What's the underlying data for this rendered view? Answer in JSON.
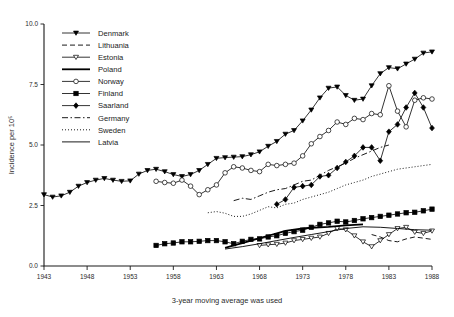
{
  "chart_data": {
    "type": "line",
    "title": "",
    "xlabel": "3-year moving average was used",
    "ylabel": "Incidence per 10⁵",
    "xlim": [
      1943,
      1988
    ],
    "ylim": [
      0.0,
      10.0
    ],
    "xticks": [
      1943,
      1948,
      1953,
      1958,
      1963,
      1968,
      1973,
      1978,
      1983,
      1988
    ],
    "xtick_labels": [
      "1943",
      "1948",
      "1953",
      "1958",
      "1963",
      "1968",
      "1973",
      "1978",
      "1983",
      "1988"
    ],
    "yticks": [
      0.0,
      2.5,
      5.0,
      7.5,
      10.0
    ],
    "ytick_labels": [
      "0.0",
      "2.5",
      "5.0",
      "7.5",
      "10.0"
    ],
    "grid": false,
    "legend_position": "upper-left-inside",
    "series": [
      {
        "name": "Denmark",
        "marker": "triangle-down-filled",
        "line": "solid",
        "x": [
          1943,
          1944,
          1945,
          1946,
          1947,
          1948,
          1949,
          1950,
          1951,
          1952,
          1953,
          1954,
          1955,
          1956,
          1957,
          1958,
          1959,
          1960,
          1961,
          1962,
          1963,
          1964,
          1965,
          1966,
          1967,
          1968,
          1969,
          1970,
          1971,
          1972,
          1973,
          1974,
          1975,
          1976,
          1977,
          1978,
          1979,
          1980,
          1981,
          1982,
          1983,
          1984,
          1985,
          1986,
          1987,
          1988
        ],
        "y": [
          2.95,
          2.85,
          2.9,
          3.05,
          3.3,
          3.45,
          3.55,
          3.62,
          3.55,
          3.5,
          3.52,
          3.8,
          3.95,
          4.0,
          3.9,
          3.78,
          3.7,
          3.78,
          3.95,
          4.2,
          4.45,
          4.48,
          4.5,
          4.52,
          4.6,
          4.72,
          4.95,
          5.15,
          5.45,
          5.6,
          6.0,
          6.45,
          6.95,
          7.35,
          7.4,
          7.05,
          6.85,
          6.9,
          7.45,
          7.95,
          8.2,
          8.15,
          8.35,
          8.55,
          8.8,
          8.85
        ]
      },
      {
        "name": "Lithuania",
        "marker": "none",
        "line": "dashed",
        "x": [
          1981,
          1982,
          1983,
          1984,
          1985,
          1986,
          1987,
          1988
        ],
        "y": [
          1.3,
          1.2,
          1.05,
          1.0,
          1.12,
          1.2,
          1.15,
          1.1
        ]
      },
      {
        "name": "Estonia",
        "marker": "triangle-down-open",
        "line": "solid",
        "x": [
          1968,
          1969,
          1970,
          1971,
          1972,
          1973,
          1974,
          1975,
          1976,
          1977,
          1978,
          1979,
          1980,
          1981,
          1982,
          1983,
          1984,
          1985,
          1986,
          1987,
          1988
        ],
        "y": [
          0.85,
          0.88,
          0.9,
          0.95,
          1.05,
          1.1,
          1.15,
          1.2,
          1.35,
          1.55,
          1.5,
          1.25,
          1.0,
          0.8,
          1.05,
          1.3,
          1.55,
          1.6,
          1.4,
          1.35,
          1.45
        ]
      },
      {
        "name": "Poland",
        "marker": "none",
        "line": "solid-thick",
        "x": [
          1964,
          1965,
          1966,
          1967,
          1968,
          1969,
          1970,
          1971,
          1972,
          1973,
          1974,
          1975,
          1976,
          1977,
          1978,
          1979,
          1980
        ],
        "y": [
          0.75,
          0.85,
          0.95,
          1.05,
          1.15,
          1.25,
          1.35,
          1.45,
          1.5,
          1.55,
          1.58,
          1.6,
          1.62,
          1.65,
          1.68,
          1.7,
          1.72
        ]
      },
      {
        "name": "Norway",
        "marker": "circle-open",
        "line": "solid",
        "x": [
          1956,
          1957,
          1958,
          1959,
          1960,
          1961,
          1962,
          1963,
          1964,
          1965,
          1966,
          1967,
          1968,
          1969,
          1970,
          1971,
          1972,
          1973,
          1974,
          1975,
          1976,
          1977,
          1978,
          1979,
          1980,
          1981,
          1982,
          1983,
          1984,
          1985,
          1986,
          1987,
          1988
        ],
        "y": [
          3.5,
          3.45,
          3.42,
          3.55,
          3.3,
          2.95,
          3.15,
          3.35,
          3.85,
          4.1,
          4.05,
          3.95,
          3.9,
          4.2,
          4.15,
          4.2,
          4.25,
          4.55,
          5.05,
          5.35,
          5.6,
          5.95,
          5.85,
          6.1,
          6.05,
          6.3,
          6.25,
          7.45,
          6.4,
          5.75,
          6.85,
          6.95,
          6.9
        ]
      },
      {
        "name": "Finland",
        "marker": "square-filled",
        "line": "solid",
        "x": [
          1956,
          1957,
          1958,
          1959,
          1960,
          1961,
          1962,
          1963,
          1964,
          1965,
          1966,
          1967,
          1968,
          1969,
          1970,
          1971,
          1972,
          1973,
          1974,
          1975,
          1976,
          1977,
          1978,
          1979,
          1980,
          1981,
          1982,
          1983,
          1984,
          1985,
          1986,
          1987,
          1988
        ],
        "y": [
          0.85,
          0.92,
          0.95,
          1.0,
          1.0,
          1.02,
          1.05,
          1.05,
          1.0,
          0.92,
          1.02,
          1.1,
          1.12,
          1.2,
          1.25,
          1.35,
          1.42,
          1.48,
          1.6,
          1.72,
          1.78,
          1.85,
          1.82,
          1.88,
          1.95,
          2.0,
          2.05,
          2.1,
          2.15,
          2.2,
          2.22,
          2.28,
          2.35
        ]
      },
      {
        "name": "Saarland",
        "marker": "diamond-filled",
        "line": "solid",
        "x": [
          1970,
          1971,
          1972,
          1973,
          1974,
          1975,
          1976,
          1977,
          1978,
          1979,
          1980,
          1981,
          1982,
          1983,
          1984,
          1985,
          1986,
          1987,
          1988
        ],
        "y": [
          2.55,
          2.75,
          3.25,
          3.3,
          3.35,
          3.7,
          3.75,
          4.05,
          4.3,
          4.55,
          4.9,
          4.9,
          4.35,
          5.55,
          5.85,
          6.55,
          7.15,
          6.55,
          5.7
        ]
      },
      {
        "name": "Germany",
        "marker": "none",
        "line": "dash-dot",
        "x": [
          1965,
          1966,
          1967,
          1968,
          1969,
          1970,
          1971,
          1972,
          1973,
          1974,
          1975,
          1976,
          1977,
          1978,
          1979,
          1980,
          1981,
          1982,
          1983
        ],
        "y": [
          2.7,
          2.8,
          2.75,
          2.9,
          3.05,
          3.15,
          3.2,
          3.35,
          3.5,
          3.55,
          3.75,
          3.95,
          4.1,
          4.25,
          4.45,
          4.6,
          4.75,
          4.9,
          5.0
        ]
      },
      {
        "name": "Sweden",
        "marker": "none",
        "line": "dotted",
        "x": [
          1962,
          1963,
          1964,
          1965,
          1966,
          1967,
          1968,
          1969,
          1970,
          1971,
          1972,
          1973,
          1974,
          1975,
          1976,
          1977,
          1978,
          1979,
          1980,
          1981,
          1982,
          1983,
          1984,
          1985,
          1986,
          1987,
          1988
        ],
        "y": [
          2.2,
          2.25,
          2.18,
          2.05,
          2.05,
          2.15,
          2.3,
          2.45,
          2.4,
          2.55,
          2.6,
          2.75,
          2.85,
          2.95,
          3.05,
          3.2,
          3.35,
          3.45,
          3.55,
          3.7,
          3.8,
          3.9,
          4.0,
          4.05,
          4.1,
          4.15,
          4.2
        ]
      },
      {
        "name": "Latvia",
        "marker": "none",
        "line": "solid-thin",
        "x": [
          1964,
          1966,
          1968,
          1970,
          1972,
          1974,
          1976,
          1978,
          1980,
          1982,
          1984,
          1986,
          1988
        ],
        "y": [
          0.7,
          0.8,
          0.92,
          1.05,
          1.18,
          1.3,
          1.42,
          1.55,
          1.62,
          1.6,
          1.55,
          1.5,
          1.48
        ]
      }
    ]
  },
  "legend": {
    "entries": [
      {
        "label": "Denmark"
      },
      {
        "label": "Lithuania"
      },
      {
        "label": "Estonia"
      },
      {
        "label": "Poland"
      },
      {
        "label": "Norway"
      },
      {
        "label": "Finland"
      },
      {
        "label": "Saarland"
      },
      {
        "label": "Germany"
      },
      {
        "label": "Sweden"
      },
      {
        "label": "Latvia"
      }
    ]
  }
}
